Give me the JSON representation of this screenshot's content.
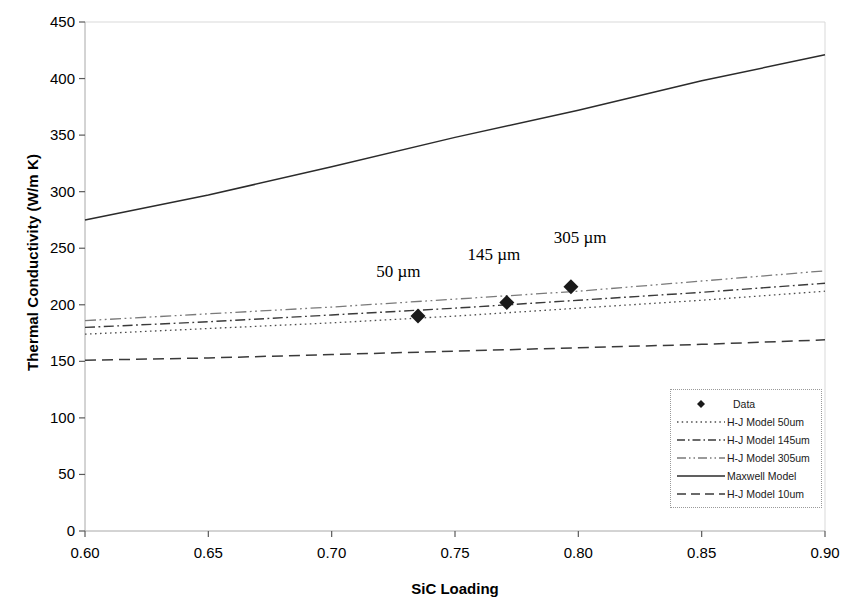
{
  "chart_data": {
    "type": "line",
    "title": "",
    "xlabel": "SiC Loading",
    "ylabel": "Thermal Conductivity (W/m K)",
    "xlim": [
      0.6,
      0.9
    ],
    "ylim": [
      0,
      450
    ],
    "xticks": [
      "0.60",
      "0.65",
      "0.70",
      "0.75",
      "0.80",
      "0.85",
      "0.90"
    ],
    "xtick_values": [
      0.6,
      0.65,
      0.7,
      0.75,
      0.8,
      0.85,
      0.9
    ],
    "yticks": [
      "0",
      "50",
      "100",
      "150",
      "200",
      "250",
      "300",
      "350",
      "400",
      "450"
    ],
    "ytick_values": [
      0,
      50,
      100,
      150,
      200,
      250,
      300,
      350,
      400,
      450
    ],
    "grid": false,
    "legend_position": "lower right",
    "series": [
      {
        "name": "Data",
        "style": "markers",
        "marker": "diamond",
        "color": "#1a1a1a",
        "x": [
          0.735,
          0.771,
          0.797
        ],
        "y": [
          190,
          202,
          216
        ]
      },
      {
        "name": "H-J Model 50um",
        "style": "dotted",
        "color": "#4d4d4d",
        "x": [
          0.6,
          0.65,
          0.7,
          0.75,
          0.8,
          0.85,
          0.9
        ],
        "y": [
          174,
          179,
          184,
          190,
          197,
          204,
          212
        ]
      },
      {
        "name": "H-J Model 145um",
        "style": "dashdot",
        "color": "#3a3a3a",
        "x": [
          0.6,
          0.65,
          0.7,
          0.75,
          0.8,
          0.85,
          0.9
        ],
        "y": [
          180,
          185,
          191,
          197,
          204,
          211,
          219
        ]
      },
      {
        "name": "H-J Model 305um",
        "style": "dashdotdot",
        "color": "#7a7a7a",
        "x": [
          0.6,
          0.65,
          0.7,
          0.75,
          0.8,
          0.85,
          0.9
        ],
        "y": [
          186,
          192,
          198,
          205,
          212,
          221,
          230
        ]
      },
      {
        "name": "Maxwell Model",
        "style": "solid",
        "color": "#2b2b2b",
        "x": [
          0.6,
          0.65,
          0.7,
          0.75,
          0.8,
          0.85,
          0.9
        ],
        "y": [
          275,
          297,
          322,
          348,
          372,
          398,
          421
        ]
      },
      {
        "name": "H-J Model 10um",
        "style": "dashed",
        "color": "#3a3a3a",
        "x": [
          0.6,
          0.65,
          0.7,
          0.75,
          0.8,
          0.85,
          0.9
        ],
        "y": [
          151,
          153,
          156,
          159,
          162,
          165,
          169
        ]
      }
    ],
    "annotations": [
      {
        "text": "50 µm",
        "x": 0.731,
        "y": 228
      },
      {
        "text": "145 µm",
        "x": 0.768,
        "y": 243
      },
      {
        "text": "305 µm",
        "x": 0.803,
        "y": 258
      }
    ]
  },
  "legend": {
    "entries": [
      {
        "label": "Data"
      },
      {
        "label": "H-J Model 50um"
      },
      {
        "label": "H-J Model 145um"
      },
      {
        "label": "H-J Model 305um"
      },
      {
        "label": "Maxwell Model"
      },
      {
        "label": "H-J Model 10um"
      }
    ]
  },
  "axes": {
    "x_title": "SiC Loading",
    "y_title": "Thermal Conductivity (W/m K)"
  }
}
